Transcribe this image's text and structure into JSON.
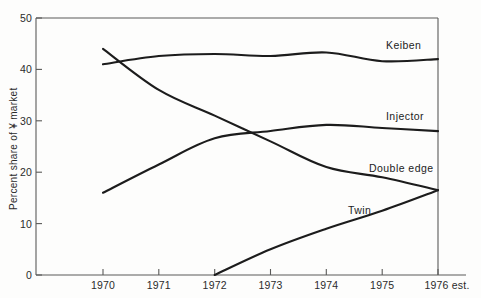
{
  "chart_data": {
    "type": "line",
    "title": "",
    "subtitle": "",
    "xlabel": "",
    "ylabel": "Percent share of ¥ market",
    "x": [
      1970,
      1971,
      1972,
      1973,
      1974,
      1975,
      1976
    ],
    "categories": [
      "1970",
      "1971",
      "1972",
      "1973",
      "1974",
      "1975",
      "1976 est."
    ],
    "xlim": [
      1970,
      1976
    ],
    "ylim": [
      0,
      50
    ],
    "y_ticks": [
      0,
      10,
      20,
      30,
      40,
      50
    ],
    "y_tick_labels": [
      "0",
      "10",
      "20",
      "30",
      "40",
      "50"
    ],
    "x_tick_labels": [
      "1970",
      "1971",
      "1972",
      "1973",
      "1974",
      "1975",
      "1976 est."
    ],
    "grid": false,
    "legend": "inline-right-labels",
    "line_color": "#1c1c1c",
    "axis_color": "#5a5a58",
    "series": [
      {
        "name": "Keiben",
        "label": "Keiben",
        "values": [
          41.0,
          42.6,
          43.0,
          42.6,
          43.3,
          41.6,
          42.0
        ]
      },
      {
        "name": "Injector",
        "label": "Injector",
        "values": [
          16.0,
          21.5,
          26.6,
          28.0,
          29.2,
          28.6,
          28.0
        ]
      },
      {
        "name": "Double edge",
        "label": "Double edge",
        "values": [
          44.0,
          36.0,
          31.0,
          26.0,
          21.0,
          19.0,
          16.5
        ]
      },
      {
        "name": "Twin",
        "label": "Twin",
        "values": [
          null,
          null,
          0.0,
          5.0,
          9.0,
          12.5,
          16.5
        ]
      }
    ],
    "annotations": [
      {
        "text": "Keiben",
        "x": 1975.0,
        "y": 44.6
      },
      {
        "text": "Injector",
        "x": 1975.0,
        "y": 30.6
      },
      {
        "text": "Double edge",
        "x": 1974.6,
        "y": 20.2
      },
      {
        "text": "Twin",
        "x": 1973.6,
        "y": 11.4
      }
    ]
  }
}
